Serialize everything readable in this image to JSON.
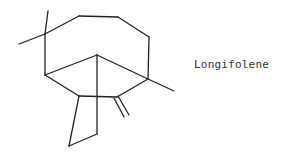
{
  "diagram": {
    "type": "chemical-structure",
    "compound_name": "Longifolene",
    "bonds": [
      {
        "id": "me1",
        "x1": 45,
        "y1": 34,
        "x2": 48,
        "y2": 11
      },
      {
        "id": "me2",
        "x1": 45,
        "y1": 34,
        "x2": 19,
        "y2": 44
      },
      {
        "id": "b1",
        "x1": 45,
        "y1": 34,
        "x2": 79,
        "y2": 16
      },
      {
        "id": "b2",
        "x1": 79,
        "y1": 16,
        "x2": 118,
        "y2": 17
      },
      {
        "id": "b3",
        "x1": 118,
        "y1": 17,
        "x2": 149,
        "y2": 37
      },
      {
        "id": "b4",
        "x1": 149,
        "y1": 37,
        "x2": 148,
        "y2": 79
      },
      {
        "id": "me3",
        "x1": 148,
        "y1": 79,
        "x2": 174,
        "y2": 91
      },
      {
        "id": "b5",
        "x1": 45,
        "y1": 34,
        "x2": 45,
        "y2": 75
      },
      {
        "id": "b6",
        "x1": 45,
        "y1": 75,
        "x2": 97,
        "y2": 55
      },
      {
        "id": "b7",
        "x1": 97,
        "y1": 55,
        "x2": 148,
        "y2": 79
      },
      {
        "id": "b8",
        "x1": 45,
        "y1": 75,
        "x2": 79,
        "y2": 96
      },
      {
        "id": "b9",
        "x1": 79,
        "y1": 96,
        "x2": 117,
        "y2": 97
      },
      {
        "id": "b10",
        "x1": 117,
        "y1": 97,
        "x2": 148,
        "y2": 79
      },
      {
        "id": "b11",
        "x1": 97,
        "y1": 55,
        "x2": 97,
        "y2": 134
      },
      {
        "id": "b12",
        "x1": 79,
        "y1": 96,
        "x2": 69,
        "y2": 146
      },
      {
        "id": "b13",
        "x1": 69,
        "y1": 146,
        "x2": 97,
        "y2": 134
      },
      {
        "id": "db1",
        "x1": 114,
        "y1": 98,
        "x2": 124,
        "y2": 117
      },
      {
        "id": "db2",
        "x1": 118,
        "y1": 96,
        "x2": 129,
        "y2": 115
      }
    ]
  }
}
